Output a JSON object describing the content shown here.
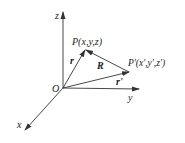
{
  "diagram": {
    "type": "3d-coordinate-vector-diagram",
    "axes": {
      "x": {
        "label": "x"
      },
      "y": {
        "label": "y"
      },
      "z": {
        "label": "z"
      }
    },
    "origin": {
      "label": "O"
    },
    "points": [
      {
        "id": "P",
        "label": "P(x,y,z)"
      },
      {
        "id": "P_prime",
        "label": "P'(x',y',z')"
      }
    ],
    "vectors": [
      {
        "id": "r",
        "label": "r",
        "from": "O",
        "to": "P"
      },
      {
        "id": "r_prime",
        "label": "r'",
        "from": "O",
        "to": "P'"
      },
      {
        "id": "R",
        "label": "R",
        "from": "P'",
        "to": "P"
      }
    ],
    "colors": {
      "line": "#333333",
      "background": "#ffffff"
    }
  }
}
